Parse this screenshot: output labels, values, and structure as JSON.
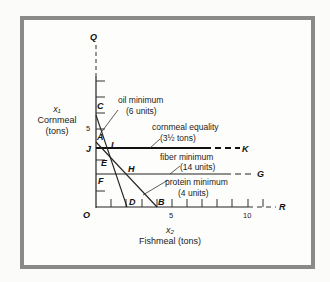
{
  "axes": {
    "y_var": "x₁",
    "y_label": "Cornmeal",
    "y_unit": "(tons)",
    "x_var": "x₂",
    "x_label": "Fishmeal (tons)",
    "y_ticks": [
      "5"
    ],
    "x_ticks": [
      "5",
      "10"
    ],
    "origin": "O"
  },
  "points": {
    "Q": "Q",
    "C": "C",
    "A": "A",
    "J": "J",
    "L": "L",
    "K": "K",
    "E": "E",
    "H": "H",
    "G": "G",
    "F": "F",
    "D": "D",
    "B": "B",
    "R": "R"
  },
  "constraints": {
    "oil": {
      "title": "oil minimum",
      "sub": "(6 units)"
    },
    "cornmeal": {
      "title": "cornmeal equality",
      "sub": "(3½ tons)"
    },
    "fiber": {
      "title": "fiber  minimum",
      "sub": "(14 units)"
    },
    "protein": {
      "title": "protein minimum",
      "sub": "(4 units)"
    }
  },
  "colors": {
    "frame": "#8a8a8a",
    "ink": "#1a1a1a"
  }
}
